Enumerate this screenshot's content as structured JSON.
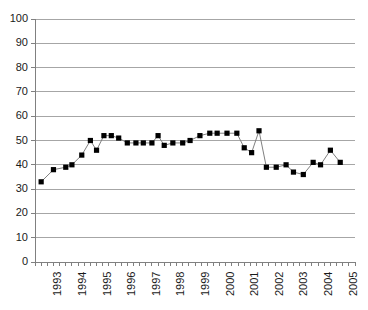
{
  "chart_data": {
    "type": "line",
    "title": "",
    "subtitle": "",
    "xlabel": "",
    "ylabel": "",
    "ylim": [
      0,
      100
    ],
    "ytick_step": 10,
    "yticks": [
      0,
      10,
      20,
      30,
      40,
      50,
      60,
      70,
      80,
      90,
      100
    ],
    "xtick_labels": [
      "1993",
      "1994",
      "1995",
      "1996",
      "1997",
      "1998",
      "1999",
      "2000",
      "2001",
      "2002",
      "2003",
      "2004",
      "2005"
    ],
    "xlim": [
      1992.5,
      2005.5
    ],
    "grid": "horizontal",
    "legend": "none",
    "marker": "square",
    "marker_color": "#000000",
    "line_color": "#808080",
    "axis_color": "#808080",
    "grid_color": "#a6a6a6",
    "series": [
      {
        "name": "series-1",
        "x": [
          1992.75,
          1993.25,
          1993.75,
          1994.25,
          1994.75,
          1995.25,
          1995.75,
          1996.25,
          1996.75,
          1997.25,
          1997.75,
          1998.25,
          1998.75,
          1999.25,
          1999.75,
          2000.25,
          2000.75,
          2001.25,
          2001.75,
          2002.25,
          2002.75,
          2003.25,
          2003.75,
          2004.25,
          2004.75
        ],
        "values": [
          33,
          38,
          39,
          40,
          44,
          50,
          46,
          52,
          52,
          51,
          49,
          49,
          49,
          48,
          51,
          49,
          49,
          50,
          51,
          53,
          53,
          53,
          47,
          45,
          54
        ]
      }
    ],
    "points": [
      {
        "x": 1992.75,
        "y": 33
      },
      {
        "x": 1993.25,
        "y": 38
      },
      {
        "x": 1993.75,
        "y": 39
      },
      {
        "x": 1994.0,
        "y": 40
      },
      {
        "x": 1994.4,
        "y": 44
      },
      {
        "x": 1994.75,
        "y": 50
      },
      {
        "x": 1995.0,
        "y": 46
      },
      {
        "x": 1995.3,
        "y": 52
      },
      {
        "x": 1995.6,
        "y": 52
      },
      {
        "x": 1995.9,
        "y": 51
      },
      {
        "x": 1996.25,
        "y": 49
      },
      {
        "x": 1996.6,
        "y": 49
      },
      {
        "x": 1996.9,
        "y": 49
      },
      {
        "x": 1997.25,
        "y": 49
      },
      {
        "x": 1997.5,
        "y": 52
      },
      {
        "x": 1997.75,
        "y": 48
      },
      {
        "x": 1998.1,
        "y": 49
      },
      {
        "x": 1998.5,
        "y": 49
      },
      {
        "x": 1998.8,
        "y": 50
      },
      {
        "x": 1999.2,
        "y": 52
      },
      {
        "x": 1999.6,
        "y": 53
      },
      {
        "x": 1999.9,
        "y": 53
      },
      {
        "x": 2000.3,
        "y": 53
      },
      {
        "x": 2000.7,
        "y": 53
      },
      {
        "x": 2001.0,
        "y": 47
      },
      {
        "x": 2001.3,
        "y": 45
      },
      {
        "x": 2001.6,
        "y": 54
      },
      {
        "x": 2001.9,
        "y": 39
      },
      {
        "x": 2002.3,
        "y": 39
      },
      {
        "x": 2002.7,
        "y": 40
      },
      {
        "x": 2003.0,
        "y": 37
      },
      {
        "x": 2003.4,
        "y": 36
      },
      {
        "x": 2003.8,
        "y": 41
      },
      {
        "x": 2004.1,
        "y": 40
      },
      {
        "x": 2004.5,
        "y": 46
      },
      {
        "x": 2004.9,
        "y": 41
      }
    ]
  }
}
